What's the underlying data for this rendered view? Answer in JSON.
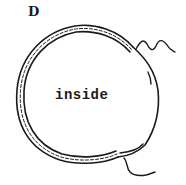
{
  "figure": {
    "panel_label": "D",
    "center_label": "inside",
    "shape": "closed membrane vesicle (double-line bilayer with dashed core), open/fused region on right side",
    "tails": [
      "upper-right wavy strand",
      "lower-right wavy strand"
    ],
    "colors": {
      "ink": "#1a1a1a",
      "background": "#ffffff"
    }
  }
}
